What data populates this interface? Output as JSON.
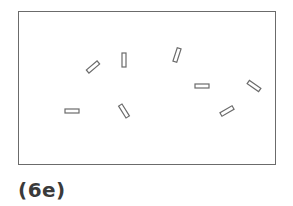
{
  "figure": {
    "label": "(6e)",
    "frame": {
      "x": 18,
      "y": 11,
      "width": 258,
      "height": 154
    },
    "stroke_color": "#6b6b6b",
    "bar_size": {
      "length": 14,
      "thickness": 4
    },
    "bars": [
      {
        "cx": 93,
        "cy": 67,
        "angle": -40
      },
      {
        "cx": 124,
        "cy": 60,
        "angle": 90
      },
      {
        "cx": 177,
        "cy": 55,
        "angle": -72
      },
      {
        "cx": 202,
        "cy": 86,
        "angle": 0
      },
      {
        "cx": 254,
        "cy": 86,
        "angle": 35
      },
      {
        "cx": 72,
        "cy": 111,
        "angle": 0
      },
      {
        "cx": 124,
        "cy": 111,
        "angle": 58
      },
      {
        "cx": 227,
        "cy": 111,
        "angle": -30
      }
    ]
  }
}
